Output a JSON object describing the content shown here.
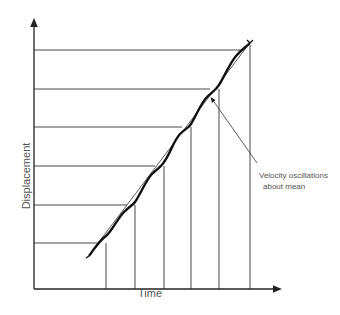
{
  "diagram": {
    "xlabel": "Time",
    "ylabel": "Displacement",
    "annotation_line1": "Velocity oscillations",
    "annotation_line2": "about mean",
    "horizontal_levels_y": [
      50,
      89,
      127,
      166,
      205,
      243
    ],
    "vertical_times_x": [
      106,
      135,
      164,
      191,
      219,
      250
    ]
  }
}
